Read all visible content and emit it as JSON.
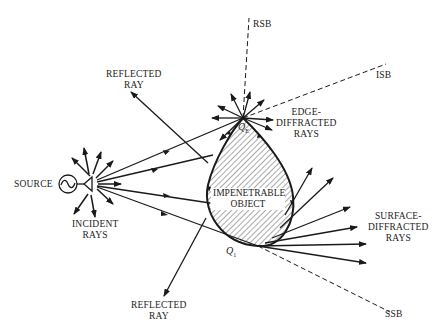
{
  "diagram": {
    "labels": {
      "source": "SOURCE",
      "incident_rays": [
        "INCIDENT",
        "RAYS"
      ],
      "reflected_ray_top": [
        "REFLECTED",
        "RAY"
      ],
      "reflected_ray_bottom": [
        "REFLECTED",
        "RAY"
      ],
      "edge_diffracted": [
        "EDGE-",
        "DIFFRACTED",
        "RAYS"
      ],
      "surface_diffracted": [
        "SURFACE-",
        "DIFFRACTED",
        "RAYS"
      ],
      "object": [
        "IMPENETRABLE",
        "OBJECT"
      ],
      "rsb": "RSB",
      "isb": "ISB",
      "ssb": "SSB",
      "q_edge": "Q",
      "q_edge_sub": "E",
      "q_one": "Q",
      "q_one_sub": "1"
    },
    "colors": {
      "ink": "#1a1a1a",
      "background": "#ffffff"
    }
  }
}
